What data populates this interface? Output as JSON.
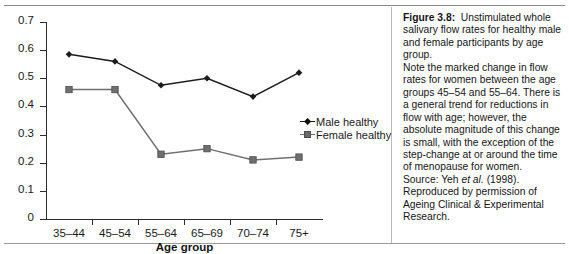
{
  "chart_data": {
    "type": "line",
    "title": "",
    "xlabel": "Age group",
    "ylabel": "Flow rate (ml min⁻¹)",
    "categories": [
      "35–44",
      "45–54",
      "55–64",
      "65–69",
      "70–74",
      "75+"
    ],
    "ylim": [
      0,
      0.7
    ],
    "ytick_labels": [
      "0",
      "0.1",
      "0.2",
      "0.3",
      "0.4",
      "0.5",
      "0.6",
      "0.7"
    ],
    "ytick_values": [
      0,
      0.1,
      0.2,
      0.3,
      0.4,
      0.5,
      0.6,
      0.7
    ],
    "grid": false,
    "legend_position": "right-inside",
    "series": [
      {
        "name": "Male healthy",
        "color": "#1c1c1c",
        "marker": "diamond",
        "values": [
          0.585,
          0.56,
          0.475,
          0.5,
          0.435,
          0.52
        ]
      },
      {
        "name": "Female healthy",
        "color": "#6f6f6f",
        "marker": "square",
        "values": [
          0.46,
          0.46,
          0.23,
          0.25,
          0.21,
          0.22
        ]
      }
    ]
  },
  "legend": {
    "items": [
      {
        "label": "Male healthy"
      },
      {
        "label": "Female healthy"
      }
    ]
  },
  "axes": {
    "y_title_main": "Flow rate (ml min",
    "y_title_sup": "−1",
    "y_title_close": ")",
    "x_title": "Age group"
  },
  "caption": {
    "figure_label": "Figure 3.8:",
    "line1": "Unstimulated whole salivary flow rates for healthy male and female participants by age group.",
    "line2": "Note the marked change in flow rates for women between the age groups 45–54 and 55–64. There is a general trend for reductions in flow with age; however, the absolute magnitude of this change is small, with the exception of the step-change at or around the time of menopause for women.",
    "source_prefix": "Source: Yeh",
    "source_italic": "et al.",
    "source_suffix": "(1998).",
    "permission": "Reproduced by permission of Ageing Clinical & Experimental Research."
  },
  "colors": {
    "male": "#1c1c1c",
    "female": "#6f6f6f",
    "axis": "#2b2b2b",
    "rule": "#8a8a8a",
    "text": "#151515"
  }
}
